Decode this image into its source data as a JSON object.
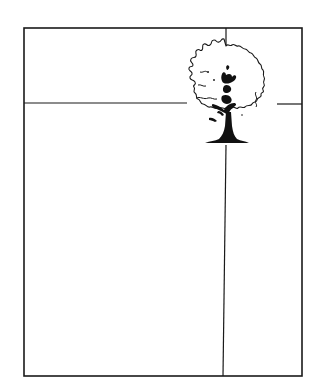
{
  "diagram": {
    "type": "composition-grid",
    "colors": {
      "background": "#ffffff",
      "stroke": "#1a1a1a",
      "tree_fill": "#111111"
    },
    "frame": {
      "x1": 24,
      "y1": 28,
      "x2": 302,
      "y2": 376
    },
    "horizontal_line": {
      "y": 103,
      "x_start": 24,
      "x_end": 302,
      "interrupted_by": "tree"
    },
    "vertical_line": {
      "x_top": 226,
      "x_bottom": 223,
      "y_start": 28,
      "y_end": 376,
      "interrupted_by": "tree"
    },
    "intersection": {
      "x": 226,
      "y": 103
    },
    "subject": {
      "label": "tree",
      "icon": "tree-icon",
      "bounds": {
        "x": 190,
        "y": 43,
        "width": 86,
        "height": 101
      }
    }
  }
}
